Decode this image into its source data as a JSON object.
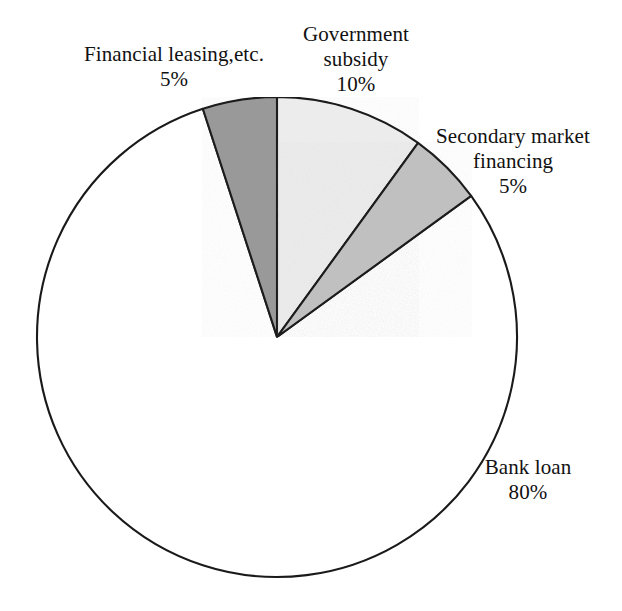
{
  "chart_data": {
    "type": "pie",
    "title": "",
    "subtitle": "",
    "xlabel": "",
    "ylabel": "",
    "legend_position": "none",
    "grid": false,
    "labels_outside": true,
    "start_angle_deg": 0,
    "direction": "clockwise",
    "categories": [
      "Government subsidy",
      "Secondary market financing",
      "Bank loan",
      "Financial leasing,etc."
    ],
    "values": [
      10,
      5,
      80,
      5
    ],
    "value_suffix": "%",
    "slices": [
      {
        "name": "Government subsidy",
        "label_line1": "Government",
        "label_line2": "subsidy",
        "value": 10,
        "value_text": "10%",
        "color": "#ececec",
        "start_angle_deg": 0,
        "end_angle_deg": 36
      },
      {
        "name": "Secondary market financing",
        "label_line1": "Secondary market",
        "label_line2": "financing",
        "value": 5,
        "value_text": "5%",
        "color": "#c0c0c0",
        "start_angle_deg": 36,
        "end_angle_deg": 54
      },
      {
        "name": "Bank loan",
        "label_line1": "Bank loan",
        "label_line2": "",
        "value": 80,
        "value_text": "80%",
        "color": "#ffffff",
        "start_angle_deg": 54,
        "end_angle_deg": 342
      },
      {
        "name": "Financial leasing,etc.",
        "label_line1": "Financial leasing,etc.",
        "label_line2": "",
        "value": 5,
        "value_text": "5%",
        "color": "#999999",
        "start_angle_deg": 342,
        "end_angle_deg": 360
      }
    ],
    "geometry": {
      "center_x": 277,
      "center_y": 337,
      "radius": 240
    },
    "stroke_color": "#1a1a1a",
    "background_color": "#ffffff"
  },
  "labels": {
    "financial_leasing": {
      "name": "Financial leasing,etc.",
      "value": "5%"
    },
    "government_subsidy": {
      "name_line1": "Government",
      "name_line2": "subsidy",
      "value": "10%"
    },
    "secondary_market": {
      "name_line1": "Secondary market",
      "name_line2": "financing",
      "value": "5%"
    },
    "bank_loan": {
      "name": "Bank loan",
      "value": "80%"
    }
  }
}
